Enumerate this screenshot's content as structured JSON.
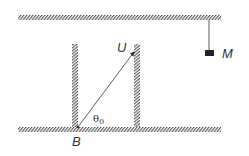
{
  "diagram": {
    "labels": {
      "velocity": "U",
      "mass": "M",
      "point": "B",
      "angle": "θ",
      "angle_subscript": "0"
    },
    "colors": {
      "ink": "#333333",
      "hatch": "#555555",
      "background": "#ffffff"
    }
  }
}
